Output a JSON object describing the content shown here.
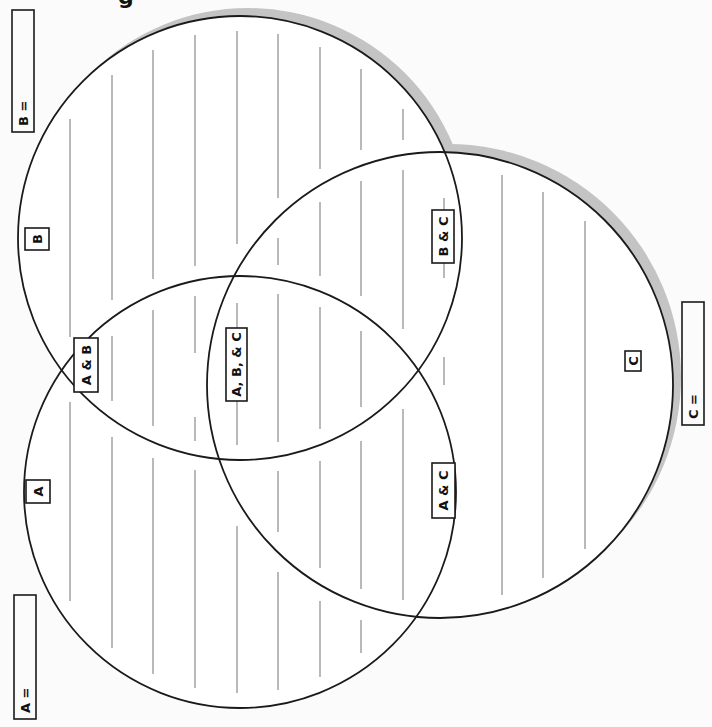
{
  "title_fragment": "g",
  "colors": {
    "background": "#fbfbfb",
    "stroke": "#1a1a1a",
    "shadow": "#c4c4c4",
    "ruled_line": "#8a8a8a"
  },
  "circles": [
    {
      "id": "B",
      "cx": 240,
      "cy": 238,
      "r": 222,
      "shadow": true
    },
    {
      "id": "A",
      "cx": 240,
      "cy": 492,
      "r": 216,
      "shadow": false
    },
    {
      "id": "C",
      "cx": 440,
      "cy": 385,
      "r": 233,
      "shadow": true
    }
  ],
  "shadow_offset": {
    "dx": 8,
    "dy": -8
  },
  "ruled_lines_x": [
    70,
    112,
    153,
    195,
    237,
    278,
    320,
    361,
    403,
    444,
    502,
    543,
    585
  ],
  "labels": [
    {
      "name": "label-set-b",
      "text": "B",
      "x": 25,
      "y": 228,
      "w": 24,
      "h": 22
    },
    {
      "name": "label-set-a",
      "text": "A",
      "x": 26,
      "y": 480,
      "w": 24,
      "h": 23
    },
    {
      "name": "label-a-and-b",
      "text": "A & B",
      "x": 74,
      "y": 338,
      "w": 24,
      "h": 54
    },
    {
      "name": "label-a-b-and-c",
      "text": "A, B, & C",
      "x": 226,
      "y": 328,
      "w": 21,
      "h": 73
    },
    {
      "name": "label-b-and-c",
      "text": "B & C",
      "x": 432,
      "y": 210,
      "w": 22,
      "h": 53
    },
    {
      "name": "label-a-and-c",
      "text": "A & C",
      "x": 432,
      "y": 463,
      "w": 23,
      "h": 55
    },
    {
      "name": "label-set-c",
      "text": "C",
      "x": 625,
      "y": 351,
      "w": 16,
      "h": 20
    }
  ],
  "answer_boxes": [
    {
      "name": "answer-box-b",
      "text": "B =",
      "x": 12,
      "y": 10,
      "w": 22,
      "h": 122
    },
    {
      "name": "answer-box-a",
      "text": "A =",
      "x": 14,
      "y": 595,
      "w": 22,
      "h": 124
    },
    {
      "name": "answer-box-c",
      "text": "C =",
      "x": 682,
      "y": 302,
      "w": 22,
      "h": 123
    }
  ]
}
